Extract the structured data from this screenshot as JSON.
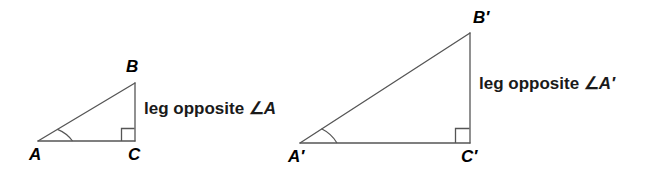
{
  "figure": {
    "background_color": "#ffffff",
    "stroke_color": "#555555",
    "text_color": "#000000"
  },
  "triangles": [
    {
      "name": "triangle-abc",
      "vertices": {
        "a": {
          "label": "A",
          "x": 38,
          "y": 141
        },
        "b": {
          "label": "B",
          "x": 135,
          "y": 83
        },
        "c": {
          "label": "C",
          "x": 135,
          "y": 141
        }
      },
      "right_angle_at": "C",
      "marked_angle_at": "A",
      "caption": {
        "prefix": "leg opposite ",
        "angle_symbol": "∠",
        "angle_name": "A",
        "full": "leg opposite ∠A"
      }
    },
    {
      "name": "triangle-a-prime-b-prime-c-prime",
      "vertices": {
        "a": {
          "label": "A′",
          "x": 300,
          "y": 143
        },
        "b": {
          "label": "B′",
          "x": 470,
          "y": 33
        },
        "c": {
          "label": "C′",
          "x": 470,
          "y": 143
        }
      },
      "right_angle_at": "C′",
      "marked_angle_at": "A′",
      "caption": {
        "prefix": "leg opposite ",
        "angle_symbol": "∠",
        "angle_name": "A′",
        "full": "leg opposite ∠A′"
      }
    }
  ]
}
